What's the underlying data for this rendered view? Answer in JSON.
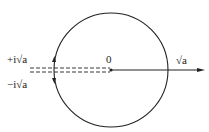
{
  "diagram": {
    "origin_label": "0",
    "positive_axis_label": "√a",
    "upper_branch_label": "+i√a",
    "lower_branch_label": "−i√a",
    "colors": {
      "stroke": "#222222",
      "background": "#ffffff"
    }
  }
}
